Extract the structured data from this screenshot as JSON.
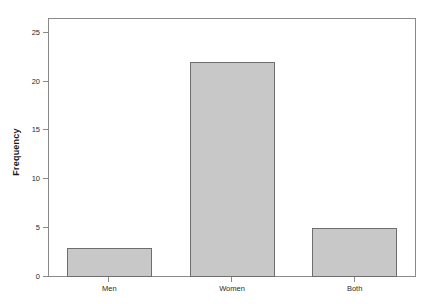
{
  "chart_data": {
    "type": "bar",
    "title": "",
    "subtitle": "",
    "xlabel": "",
    "ylabel": "Frequency",
    "categories": [
      "Men",
      "Women",
      "Both"
    ],
    "values": [
      3,
      22,
      5
    ],
    "series": [
      {
        "name": "Frequency",
        "values": [
          3,
          22,
          5
        ]
      }
    ],
    "yticks": [
      0,
      5,
      10,
      15,
      20,
      25
    ],
    "ytick_labels": [
      "0",
      "5",
      "10",
      "15",
      "20",
      "25"
    ],
    "ylim": [
      0,
      26.5
    ],
    "xlim": [
      0,
      3
    ],
    "grid": false,
    "legend": false,
    "legend_position": "none",
    "annotations": [],
    "bar_fill_color": "#c8c8c8",
    "bar_edge_color": "#6e6e6e",
    "frame_color": "#8a8a8a",
    "background_color": "#ffffff",
    "text_color": "#2b2b2b"
  }
}
